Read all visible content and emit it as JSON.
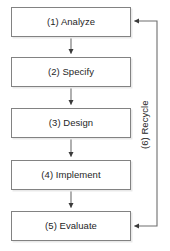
{
  "diagram": {
    "background_color": "#ffffff",
    "box_border_color": "#828282",
    "text_color": "#262626",
    "connector_color": "#6e6e6e",
    "nodes": [
      {
        "id": "analyze",
        "label": "(1) Analyze",
        "step": 1
      },
      {
        "id": "specify",
        "label": "(2) Specify",
        "step": 2
      },
      {
        "id": "design",
        "label": "(3) Design",
        "step": 3
      },
      {
        "id": "implement",
        "label": "(4) Implement",
        "step": 4
      },
      {
        "id": "evaluate",
        "label": "(5) Evaluate",
        "step": 5
      }
    ],
    "feedback": {
      "id": "recycle",
      "label": "(6) Recycle",
      "step": 6,
      "from": "evaluate",
      "to": "analyze",
      "orientation": "vertical-rotated"
    },
    "connectors": [
      {
        "from": "analyze",
        "to": "specify",
        "type": "arrow-down"
      },
      {
        "from": "specify",
        "to": "design",
        "type": "arrow-down"
      },
      {
        "from": "design",
        "to": "implement",
        "type": "arrow-down"
      },
      {
        "from": "implement",
        "to": "evaluate",
        "type": "arrow-down"
      },
      {
        "from": "evaluate",
        "to": "analyze",
        "type": "feedback-loop-right"
      }
    ]
  }
}
